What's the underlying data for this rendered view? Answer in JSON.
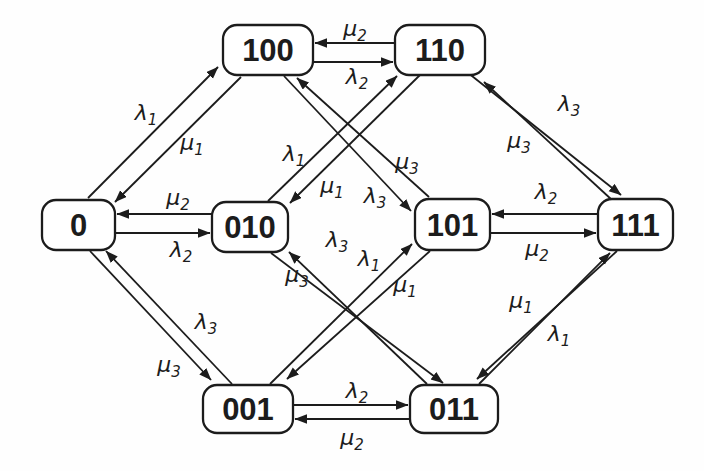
{
  "figure": {
    "type": "markov-state-transition-diagram",
    "background": "#fefefe",
    "stroke_color": "#1c1c1c",
    "box_fill": "#ffffff",
    "states": [
      {
        "id": "0",
        "label": "0",
        "x": 42,
        "y": 200,
        "w": 73,
        "h": 50
      },
      {
        "id": "100",
        "label": "100",
        "x": 223,
        "y": 25,
        "w": 90,
        "h": 50
      },
      {
        "id": "110",
        "label": "110",
        "x": 395,
        "y": 25,
        "w": 90,
        "h": 50
      },
      {
        "id": "010",
        "label": "010",
        "x": 212,
        "y": 202,
        "w": 76,
        "h": 50
      },
      {
        "id": "101",
        "label": "101",
        "x": 415,
        "y": 199,
        "w": 75,
        "h": 51
      },
      {
        "id": "111",
        "label": "111",
        "x": 598,
        "y": 199,
        "w": 75,
        "h": 51
      },
      {
        "id": "001",
        "label": "001",
        "x": 203,
        "y": 385,
        "w": 90,
        "h": 48
      },
      {
        "id": "011",
        "label": "011",
        "x": 410,
        "y": 385,
        "w": 88,
        "h": 48
      }
    ],
    "transitions": [
      {
        "from": "0",
        "to": "100",
        "symbol": "λ",
        "sub": "1",
        "x1": 88,
        "y1": 198,
        "x2": 218,
        "y2": 67,
        "lx": 146,
        "ly": 112
      },
      {
        "from": "100",
        "to": "0",
        "symbol": "μ",
        "sub": "1",
        "x1": 241,
        "y1": 77,
        "x2": 115,
        "y2": 202,
        "lx": 192,
        "ly": 142
      },
      {
        "from": "010",
        "to": "0",
        "symbol": "μ",
        "sub": "2",
        "x1": 212,
        "y1": 214,
        "x2": 117,
        "y2": 214,
        "lx": 178,
        "ly": 197
      },
      {
        "from": "0",
        "to": "010",
        "symbol": "λ",
        "sub": "2",
        "x1": 115,
        "y1": 233,
        "x2": 210,
        "y2": 233,
        "lx": 181,
        "ly": 249
      },
      {
        "from": "0",
        "to": "001",
        "symbol": "λ",
        "sub": "3",
        "x1": 90,
        "y1": 251,
        "x2": 211,
        "y2": 380,
        "lx": 206,
        "ly": 321
      },
      {
        "from": "001",
        "to": "0",
        "symbol": "μ",
        "sub": "3",
        "x1": 232,
        "y1": 384,
        "x2": 106,
        "y2": 251,
        "lx": 169,
        "ly": 364
      },
      {
        "from": "110",
        "to": "100",
        "symbol": "μ",
        "sub": "2",
        "x1": 395,
        "y1": 43,
        "x2": 315,
        "y2": 43,
        "lx": 355,
        "ly": 28
      },
      {
        "from": "100",
        "to": "110",
        "symbol": "λ",
        "sub": "2",
        "x1": 313,
        "y1": 62,
        "x2": 393,
        "y2": 62,
        "lx": 357,
        "ly": 76
      },
      {
        "from": "100",
        "to": "101",
        "symbol": "λ",
        "sub": "3",
        "x1": 284,
        "y1": 76,
        "x2": 411,
        "y2": 211,
        "lx": 375,
        "ly": 195
      },
      {
        "from": "101",
        "to": "100",
        "symbol": "μ",
        "sub": "3",
        "x1": 429,
        "y1": 197,
        "x2": 297,
        "y2": 78,
        "lx": 407,
        "ly": 161
      },
      {
        "from": "010",
        "to": "110",
        "symbol": "λ",
        "sub": "1",
        "x1": 268,
        "y1": 201,
        "x2": 397,
        "y2": 76,
        "lx": 294,
        "ly": 153
      },
      {
        "from": "110",
        "to": "010",
        "symbol": "μ",
        "sub": "1",
        "x1": 421,
        "y1": 74,
        "x2": 290,
        "y2": 203,
        "lx": 332,
        "ly": 185
      },
      {
        "from": "010",
        "to": "011",
        "symbol": "λ",
        "sub": "3",
        "x1": 271,
        "y1": 253,
        "x2": 443,
        "y2": 383,
        "lx": 337,
        "ly": 239
      },
      {
        "from": "011",
        "to": "010",
        "symbol": "μ",
        "sub": "3",
        "x1": 427,
        "y1": 384,
        "x2": 289,
        "y2": 252,
        "lx": 297,
        "ly": 274
      },
      {
        "from": "001",
        "to": "101",
        "symbol": "λ",
        "sub": "1",
        "x1": 270,
        "y1": 384,
        "x2": 412,
        "y2": 244,
        "lx": 369,
        "ly": 258
      },
      {
        "from": "101",
        "to": "001",
        "symbol": "μ",
        "sub": "1",
        "x1": 430,
        "y1": 251,
        "x2": 287,
        "y2": 379,
        "lx": 405,
        "ly": 284
      },
      {
        "from": "001",
        "to": "011",
        "symbol": "λ",
        "sub": "2",
        "x1": 293,
        "y1": 405,
        "x2": 408,
        "y2": 405,
        "lx": 357,
        "ly": 390
      },
      {
        "from": "011",
        "to": "001",
        "symbol": "μ",
        "sub": "2",
        "x1": 410,
        "y1": 419,
        "x2": 295,
        "y2": 419,
        "lx": 352,
        "ly": 437
      },
      {
        "from": "110",
        "to": "111",
        "symbol": "λ",
        "sub": "3",
        "x1": 467,
        "y1": 72,
        "x2": 621,
        "y2": 195,
        "lx": 569,
        "ly": 103
      },
      {
        "from": "111",
        "to": "110",
        "symbol": "μ",
        "sub": "3",
        "x1": 612,
        "y1": 200,
        "x2": 484,
        "y2": 82,
        "lx": 519,
        "ly": 140
      },
      {
        "from": "111",
        "to": "101",
        "symbol": "λ",
        "sub": "2",
        "x1": 598,
        "y1": 214,
        "x2": 492,
        "y2": 214,
        "lx": 546,
        "ly": 191
      },
      {
        "from": "101",
        "to": "111",
        "symbol": "μ",
        "sub": "2",
        "x1": 490,
        "y1": 233,
        "x2": 596,
        "y2": 233,
        "lx": 537,
        "ly": 248
      },
      {
        "from": "011",
        "to": "111",
        "symbol": "λ",
        "sub": "1",
        "x1": 479,
        "y1": 384,
        "x2": 610,
        "y2": 253,
        "lx": 559,
        "ly": 333
      },
      {
        "from": "111",
        "to": "011",
        "symbol": "μ",
        "sub": "1",
        "x1": 617,
        "y1": 251,
        "x2": 477,
        "y2": 379,
        "lx": 521,
        "ly": 300
      }
    ]
  }
}
